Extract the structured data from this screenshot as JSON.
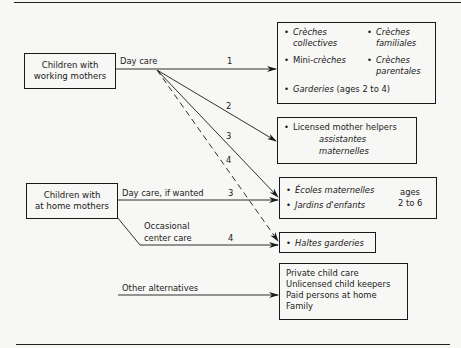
{
  "diagram": {
    "sources": {
      "working": {
        "line1": "Children with",
        "line2": "working mothers"
      },
      "home": {
        "line1": "Children with",
        "line2": "at home mothers"
      }
    },
    "edge_labels": {
      "day_care": "Day care",
      "day_care_if_wanted": "Day care, if wanted",
      "occasional_1": "Occasional",
      "occasional_2": "center care",
      "other": "Other alternatives"
    },
    "numbers": {
      "n1": "1",
      "n2": "2",
      "n3a": "3",
      "n4a": "4",
      "n3b": "3",
      "n4b": "4"
    },
    "box1": {
      "creches_collectives_1": "Crèches",
      "creches_collectives_2": "collectives",
      "creches_familiales_1": "Crèches",
      "creches_familiales_2": "familiales",
      "mini_prefix": "Mini-",
      "mini_suffix": "crèches",
      "creches_parentales_1": "Crèches",
      "creches_parentales_2": "parentales",
      "garderies": "Garderies",
      "garderies_ages": " (ages 2 to 4)"
    },
    "box2": {
      "line1": "Licensed mother helpers",
      "line2": "assistantes",
      "line3": "maternelles"
    },
    "box3": {
      "item1": "Écoles maternelles",
      "item2": "Jardins d'enfants",
      "ages1": "ages",
      "ages2": "2 to 6"
    },
    "box4": {
      "item1": "Haltes garderies"
    },
    "box5": {
      "lines": [
        "Private child care",
        "Unlicensed child keepers",
        "Paid persons at home",
        "Family"
      ]
    }
  }
}
